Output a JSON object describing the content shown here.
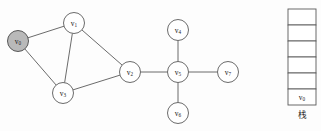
{
  "figure": {
    "background_color": "#fdfdfd",
    "stroke_color": "#5a5a5a",
    "visited_fill": "#b9b9b9",
    "node_fill": "#ffffff",
    "graph": {
      "nodes": [
        {
          "id": "v0",
          "base": "v",
          "sub": "0",
          "cx": 18,
          "cy": 41,
          "r": 10.5,
          "state": "visited"
        },
        {
          "id": "v1",
          "base": "v",
          "sub": "1",
          "cx": 74,
          "cy": 23,
          "r": 10.5,
          "state": "unvisited"
        },
        {
          "id": "v2",
          "base": "v",
          "sub": "2",
          "cx": 130,
          "cy": 72,
          "r": 10.5,
          "state": "unvisited"
        },
        {
          "id": "v3",
          "base": "v",
          "sub": "3",
          "cx": 63,
          "cy": 93,
          "r": 10.5,
          "state": "unvisited"
        },
        {
          "id": "v4",
          "base": "v",
          "sub": "4",
          "cx": 178,
          "cy": 30,
          "r": 10.5,
          "state": "unvisited"
        },
        {
          "id": "v5",
          "base": "v",
          "sub": "5",
          "cx": 178,
          "cy": 72,
          "r": 10.5,
          "state": "unvisited"
        },
        {
          "id": "v6",
          "base": "v",
          "sub": "6",
          "cx": 178,
          "cy": 113,
          "r": 10.5,
          "state": "unvisited"
        },
        {
          "id": "v7",
          "base": "v",
          "sub": "7",
          "cx": 228,
          "cy": 72,
          "r": 10.5,
          "state": "unvisited"
        }
      ],
      "edges": [
        {
          "from": "v0",
          "to": "v1"
        },
        {
          "from": "v0",
          "to": "v3"
        },
        {
          "from": "v1",
          "to": "v3"
        },
        {
          "from": "v1",
          "to": "v2"
        },
        {
          "from": "v3",
          "to": "v2"
        },
        {
          "from": "v2",
          "to": "v5"
        },
        {
          "from": "v4",
          "to": "v5"
        },
        {
          "from": "v5",
          "to": "v6"
        },
        {
          "from": "v5",
          "to": "v7"
        }
      ]
    },
    "stack": {
      "caption": "栈",
      "x": 288,
      "y": 9,
      "cell_width": 28,
      "cell_height": 16,
      "cell_count": 6,
      "cells": [
        {
          "index": 5,
          "base": "",
          "sub": "",
          "empty": true
        },
        {
          "index": 4,
          "base": "",
          "sub": "",
          "empty": true
        },
        {
          "index": 3,
          "base": "",
          "sub": "",
          "empty": true
        },
        {
          "index": 2,
          "base": "",
          "sub": "",
          "empty": true
        },
        {
          "index": 1,
          "base": "",
          "sub": "",
          "empty": true
        },
        {
          "index": 0,
          "base": "v",
          "sub": "0",
          "empty": false
        }
      ]
    }
  }
}
